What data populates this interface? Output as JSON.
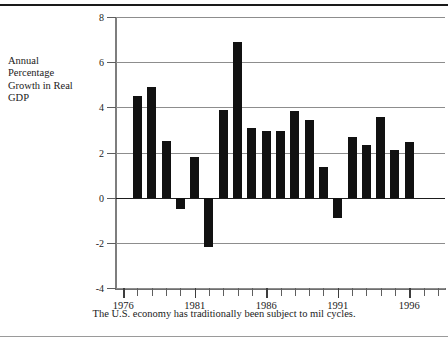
{
  "axis_label": {
    "lines": [
      "Annual",
      "Percentage",
      "Growth in Real",
      "GDP"
    ]
  },
  "caption": "The U.S. economy has traditionally been subject to mil cycles.",
  "chart_data": {
    "type": "bar",
    "title": "",
    "xlabel": "",
    "ylabel": "Annual Percentage Growth in Real GDP",
    "ylim": [
      -4,
      8
    ],
    "xlim": [
      1975.5,
      1998.5
    ],
    "yticks": [
      8,
      6,
      4,
      2,
      0,
      -2,
      -4
    ],
    "ytick_labels": [
      "8",
      "6",
      "4",
      "2",
      "0",
      "-2",
      "-4"
    ],
    "xticks": [
      1976,
      1977,
      1978,
      1979,
      1980,
      1981,
      1982,
      1983,
      1984,
      1985,
      1986,
      1987,
      1988,
      1989,
      1990,
      1991,
      1992,
      1993,
      1994,
      1995,
      1996,
      1997,
      1998
    ],
    "xtick_labels_shown": [
      "1976",
      "1981",
      "1986",
      "1991",
      "1996"
    ],
    "xtick_labels_shown_values": [
      1976,
      1981,
      1986,
      1991,
      1996
    ],
    "grid": true,
    "grid_axis": "y",
    "legend": "none",
    "bar_color": "#111111",
    "categories": [
      1977,
      1978,
      1979,
      1980,
      1981,
      1982,
      1983,
      1984,
      1985,
      1986,
      1987,
      1988,
      1989,
      1990,
      1991,
      1992,
      1993,
      1994,
      1995,
      1996,
      1997,
      1998
    ],
    "values": [
      4.5,
      4.9,
      2.5,
      -0.5,
      1.8,
      -2.2,
      3.9,
      6.9,
      3.1,
      2.95,
      2.95,
      3.85,
      3.45,
      1.35,
      -0.9,
      2.7,
      2.35,
      3.55,
      2.1,
      2.45,
      0,
      0
    ]
  },
  "bars": [
    {
      "year": 1977,
      "value": 4.5
    },
    {
      "year": 1978,
      "value": 4.9
    },
    {
      "year": 1979,
      "value": 2.5
    },
    {
      "year": 1980,
      "value": -0.5
    },
    {
      "year": 1981,
      "value": 1.8
    },
    {
      "year": 1982,
      "value": -2.2
    },
    {
      "year": 1983,
      "value": 3.9
    },
    {
      "year": 1984,
      "value": 6.9
    },
    {
      "year": 1985,
      "value": 3.1
    },
    {
      "year": 1986,
      "value": 2.95
    },
    {
      "year": 1987,
      "value": 2.95
    },
    {
      "year": 1988,
      "value": 3.85
    },
    {
      "year": 1989,
      "value": 3.45
    },
    {
      "year": 1990,
      "value": 1.35
    },
    {
      "year": 1991,
      "value": -0.9
    },
    {
      "year": 1992,
      "value": 2.7
    },
    {
      "year": 1993,
      "value": 2.35
    },
    {
      "year": 1994,
      "value": 3.55
    },
    {
      "year": 1995,
      "value": 2.1
    },
    {
      "year": 1996,
      "value": 2.45
    }
  ]
}
